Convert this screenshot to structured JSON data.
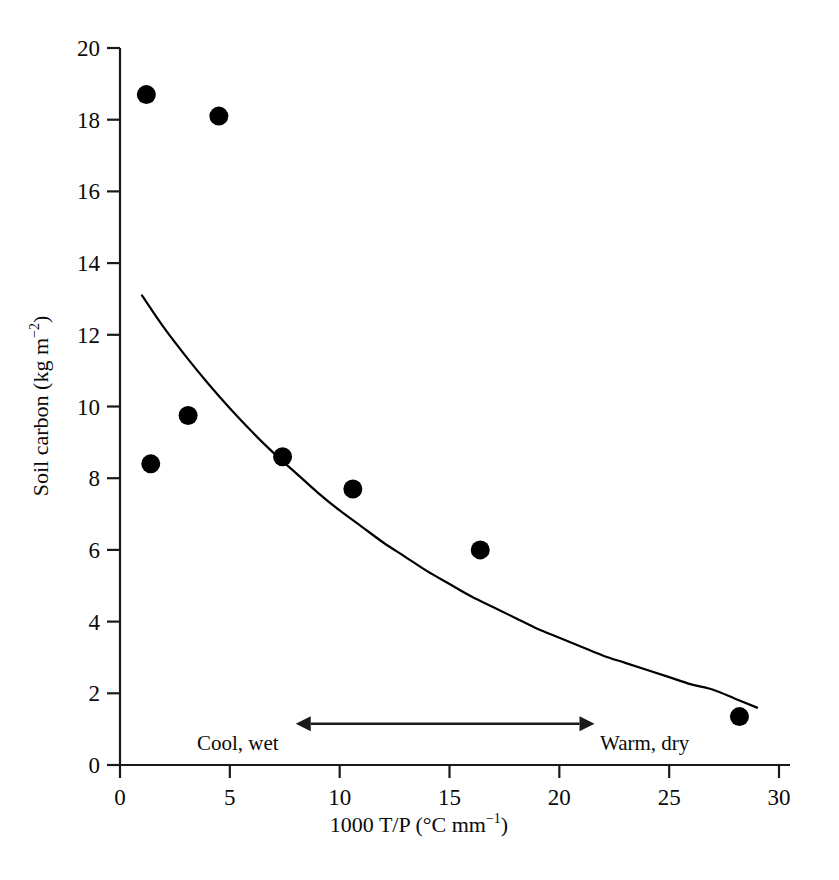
{
  "chart_data": {
    "type": "scatter",
    "title": "",
    "xlabel": "1000 T/P (°C mm⁻¹)",
    "ylabel": "Soil carbon (kg m⁻²)",
    "xlim": [
      0,
      30
    ],
    "ylim": [
      0,
      20
    ],
    "xticks": [
      0,
      5,
      10,
      15,
      20,
      25,
      30
    ],
    "yticks": [
      0,
      2,
      4,
      6,
      8,
      10,
      12,
      14,
      16,
      18,
      20
    ],
    "xtick_labels": [
      "0",
      "5",
      "10",
      "15",
      "20",
      "25",
      "30"
    ],
    "ytick_labels": [
      "0",
      "2",
      "4",
      "6",
      "8",
      "10",
      "12",
      "14",
      "16",
      "18",
      "20"
    ],
    "grid": false,
    "legend": "none",
    "series": [
      {
        "name": "Soil carbon observations",
        "marker": "filled-circle",
        "color": "#000000",
        "points": [
          {
            "x": 1.2,
            "y": 18.7
          },
          {
            "x": 4.5,
            "y": 18.1
          },
          {
            "x": 3.1,
            "y": 9.75
          },
          {
            "x": 1.4,
            "y": 8.4
          },
          {
            "x": 7.4,
            "y": 8.6
          },
          {
            "x": 10.6,
            "y": 7.7
          },
          {
            "x": 16.4,
            "y": 6.0
          },
          {
            "x": 28.2,
            "y": 1.35
          }
        ]
      },
      {
        "name": "Fitted exponential decline",
        "marker": "none",
        "line": "solid",
        "color": "#000000",
        "points": [
          {
            "x": 1.0,
            "y": 13.1
          },
          {
            "x": 2.0,
            "y": 12.2
          },
          {
            "x": 3.0,
            "y": 11.4
          },
          {
            "x": 4.0,
            "y": 10.65
          },
          {
            "x": 5.0,
            "y": 9.95
          },
          {
            "x": 6.0,
            "y": 9.3
          },
          {
            "x": 7.0,
            "y": 8.7
          },
          {
            "x": 8.0,
            "y": 8.15
          },
          {
            "x": 9.0,
            "y": 7.6
          },
          {
            "x": 10.0,
            "y": 7.1
          },
          {
            "x": 11.0,
            "y": 6.65
          },
          {
            "x": 12.0,
            "y": 6.2
          },
          {
            "x": 13.0,
            "y": 5.8
          },
          {
            "x": 14.0,
            "y": 5.4
          },
          {
            "x": 15.0,
            "y": 5.05
          },
          {
            "x": 16.0,
            "y": 4.7
          },
          {
            "x": 17.0,
            "y": 4.4
          },
          {
            "x": 18.0,
            "y": 4.1
          },
          {
            "x": 19.0,
            "y": 3.8
          },
          {
            "x": 20.0,
            "y": 3.55
          },
          {
            "x": 21.0,
            "y": 3.3
          },
          {
            "x": 22.0,
            "y": 3.05
          },
          {
            "x": 23.0,
            "y": 2.85
          },
          {
            "x": 24.0,
            "y": 2.65
          },
          {
            "x": 25.0,
            "y": 2.45
          },
          {
            "x": 26.0,
            "y": 2.25
          },
          {
            "x": 27.0,
            "y": 2.1
          },
          {
            "x": 28.0,
            "y": 1.85
          },
          {
            "x": 29.0,
            "y": 1.6
          }
        ]
      }
    ],
    "annotations": [
      {
        "type": "double-arrow",
        "label_left": "Cool, wet",
        "label_right": "Warm, dry",
        "x_start": 8.0,
        "x_end": 21.6,
        "y": 1.15
      }
    ]
  },
  "axis": {
    "x_title_main": "1000 T/P (°C mm",
    "x_title_sup": "−1",
    "x_title_tail": ")",
    "y_title_main": "Soil carbon (kg m",
    "y_title_sup": "−2",
    "y_title_tail": ")"
  },
  "annotation_text": {
    "cool_wet": "Cool, wet",
    "warm_dry": "Warm, dry"
  }
}
